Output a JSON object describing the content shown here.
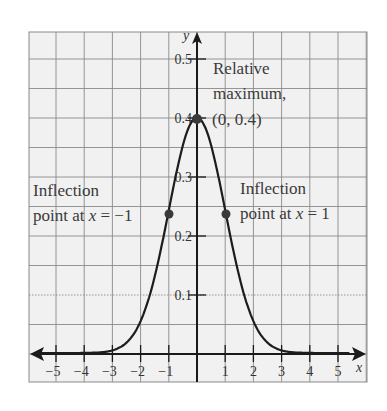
{
  "chart_data": {
    "type": "line",
    "title": "",
    "function": "standard normal density f(x) = (1/sqrt(2π)) e^(-x²/2)",
    "xlabel": "x",
    "ylabel": "y",
    "xlim": [
      -6,
      6
    ],
    "ylim": [
      -0.05,
      0.55
    ],
    "x_ticks": [
      -5,
      -4,
      -3,
      -2,
      -1,
      1,
      2,
      3,
      4,
      5
    ],
    "x_tick_labels": [
      "−5",
      "−4",
      "−3",
      "−2",
      "−1",
      "1",
      "2",
      "3",
      "4",
      "5"
    ],
    "y_ticks": [
      0.1,
      0.2,
      0.3,
      0.4,
      0.5
    ],
    "y_tick_labels": [
      "0.1",
      "0.2",
      "0.3",
      "0.4",
      "0.5"
    ],
    "grid": true,
    "series": [
      {
        "name": "f(x)",
        "x": [
          -6,
          -5,
          -4,
          -3,
          -2.5,
          -2,
          -1.5,
          -1,
          -0.5,
          0,
          0.5,
          1,
          1.5,
          2,
          2.5,
          3,
          4,
          5,
          6
        ],
        "values": [
          0.0,
          0.0,
          0.0001,
          0.0044,
          0.0175,
          0.054,
          0.1295,
          0.242,
          0.3521,
          0.3989,
          0.3521,
          0.242,
          0.1295,
          0.054,
          0.0175,
          0.0044,
          0.0001,
          0.0,
          0.0
        ]
      }
    ],
    "points": [
      {
        "label": "Relative maximum",
        "x": 0,
        "y": 0.4
      },
      {
        "label": "Inflection point",
        "x": -1,
        "y": 0.242
      },
      {
        "label": "Inflection point",
        "x": 1,
        "y": 0.242
      }
    ],
    "annotations": [
      {
        "lines": [
          "Relative",
          "maximum,",
          "(0, 0.4)"
        ]
      },
      {
        "lines": [
          "Inflection",
          "point at x = −1"
        ]
      },
      {
        "lines": [
          "Inflection",
          "point at x = 1"
        ]
      }
    ]
  },
  "labels": {
    "y_axis": "y",
    "x_axis": "x",
    "max_line1": "Relative",
    "max_line2": "maximum,",
    "max_line3": "(0, 0.4)",
    "left_line1": "Inflection",
    "left_line2_pre": "point at ",
    "left_line2_var": "x",
    "left_line2_post": " = −1",
    "right_line1": "Inflection",
    "right_line2_pre": "point at ",
    "right_line2_var": "x",
    "right_line2_post": " = 1"
  },
  "colors": {
    "curve": "#1c1c1c",
    "grid": "#8a8a8a",
    "background": "#f1f1f1",
    "text": "#3a3a3a"
  }
}
